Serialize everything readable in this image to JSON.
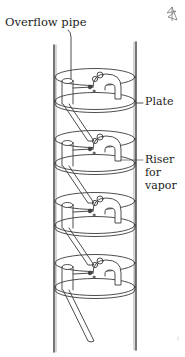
{
  "diagram": {
    "type": "fractionating-column-bubble-cap-plates",
    "stage_count": 4,
    "labels": {
      "overflow_pipe": "Overflow pipe",
      "plate": "Plate",
      "riser_line1": "Riser",
      "riser_line2": "for",
      "riser_line3": "vapor"
    },
    "corner_icon": "pencil-star-icon",
    "colors": {
      "line": "#3a3a3a",
      "wall": "#555555",
      "background": "#ffffff",
      "text": "#222222"
    }
  }
}
